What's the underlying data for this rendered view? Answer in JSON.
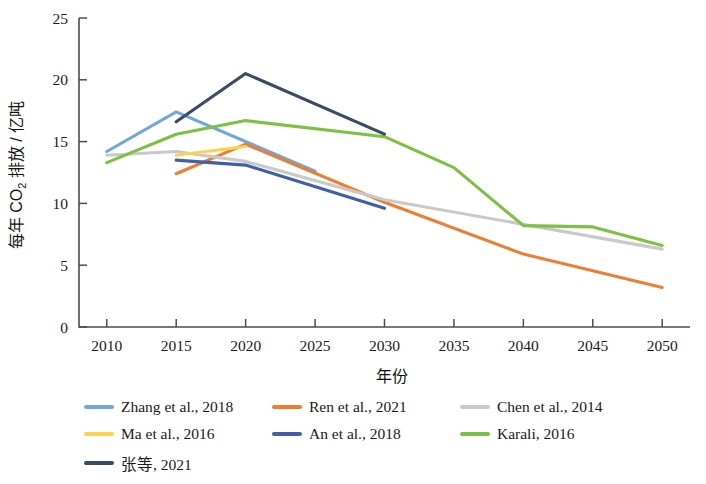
{
  "chart_data": {
    "type": "line",
    "title": "",
    "xlabel": "年份",
    "ylabel": "每年 CO2 排放 / 亿吨",
    "ylabel_parts": {
      "pre": "每年 CO",
      "sub": "2",
      "post": " 排放 / 亿吨"
    },
    "xlim": [
      2008,
      2052
    ],
    "ylim": [
      0,
      25
    ],
    "xticks": [
      2010,
      2015,
      2020,
      2025,
      2030,
      2035,
      2040,
      2045,
      2050
    ],
    "yticks": [
      0,
      5,
      10,
      15,
      20,
      25
    ],
    "grid": false,
    "legend_position": "bottom-left",
    "series": [
      {
        "name": "Zhang et al., 2018",
        "color": "#6fa8dc",
        "x": [
          2010,
          2015,
          2025
        ],
        "values": [
          14.2,
          17.4,
          12.6
        ]
      },
      {
        "name": "Ren et al., 2021",
        "color": "#ed7d31",
        "x": [
          2015,
          2020,
          2030,
          2040,
          2050
        ],
        "values": [
          12.4,
          14.8,
          10.1,
          5.9,
          3.2
        ]
      },
      {
        "name": "Chen et al., 2014",
        "color": "#c9c9c9",
        "x": [
          2010,
          2015,
          2020,
          2030,
          2040,
          2050
        ],
        "values": [
          13.9,
          14.2,
          13.4,
          10.3,
          8.3,
          6.3
        ]
      },
      {
        "name": "Ma et al., 2016",
        "color": "#ffd24d",
        "x": [
          2015,
          2020
        ],
        "values": [
          13.9,
          14.6
        ]
      },
      {
        "name": "An et al., 2018",
        "color": "#3f5fa8",
        "x": [
          2015,
          2020,
          2030
        ],
        "values": [
          13.5,
          13.1,
          9.6
        ]
      },
      {
        "name": "Karali, 2016",
        "color": "#7cc142",
        "x": [
          2010,
          2015,
          2020,
          2030,
          2035,
          2040,
          2045,
          2050
        ],
        "values": [
          13.3,
          15.6,
          16.7,
          15.4,
          12.9,
          8.2,
          8.1,
          6.6
        ]
      },
      {
        "name": "张等, 2021",
        "color": "#3b4a66",
        "x": [
          2015,
          2020,
          2030
        ],
        "values": [
          16.6,
          20.5,
          15.6
        ]
      }
    ]
  },
  "legend": {
    "items": [
      {
        "label": "Zhang et al., 2018",
        "color": "#6fa8dc"
      },
      {
        "label": "Ren et al., 2021",
        "color": "#ed7d31"
      },
      {
        "label": "Chen et al., 2014",
        "color": "#c9c9c9"
      },
      {
        "label": "Ma et al., 2016",
        "color": "#ffd24d"
      },
      {
        "label": "An et al., 2018",
        "color": "#3f5fa8"
      },
      {
        "label": "Karali, 2016",
        "color": "#7cc142"
      },
      {
        "label": "张等, 2021",
        "color": "#3b4a66"
      }
    ]
  }
}
